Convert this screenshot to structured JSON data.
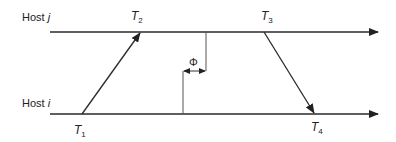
{
  "diagram": {
    "hosts": [
      {
        "id": "j",
        "label_prefix": "Host ",
        "label_var": "j"
      },
      {
        "id": "i",
        "label_prefix": "Host ",
        "label_var": "i"
      }
    ],
    "timestamps": [
      {
        "id": "T1",
        "base": "T",
        "sub": "1"
      },
      {
        "id": "T2",
        "base": "T",
        "sub": "2"
      },
      {
        "id": "T3",
        "base": "T",
        "sub": "3"
      },
      {
        "id": "T4",
        "base": "T",
        "sub": "4"
      }
    ],
    "offset_label": "Φ",
    "colors": {
      "line": "#2a2a2a",
      "thin": "#555555"
    }
  }
}
